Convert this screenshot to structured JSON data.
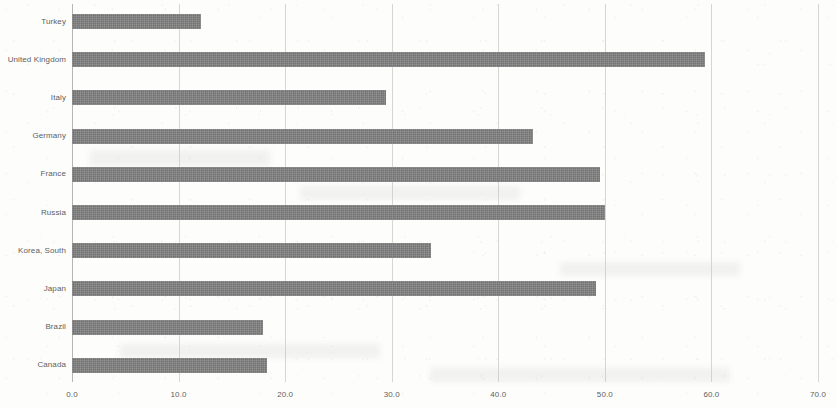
{
  "chart_data": {
    "type": "bar",
    "orientation": "horizontal",
    "title": "",
    "subtitle": "",
    "xlabel": "",
    "ylabel": "",
    "xlim": [
      0.0,
      70.0
    ],
    "xticks": [
      "0.0",
      "10.0",
      "20.0",
      "30.0",
      "40.0",
      "50.0",
      "60.0",
      "70.0"
    ],
    "xtick_values": [
      0,
      10,
      20,
      30,
      40,
      50,
      60,
      70
    ],
    "grid": true,
    "grid_axis": "x",
    "legend": null,
    "legend_position": "none",
    "bar_color": "#7e7e7e",
    "background_color": "#fdfdfc",
    "text_color": "#5d5d5d",
    "categories": [
      "Turkey",
      "United Kingdom",
      "Italy",
      "Germany",
      "France",
      "Russia",
      "Korea, South",
      "Japan",
      "Brazil",
      "Canada"
    ],
    "values": [
      12.1,
      59.4,
      29.5,
      43.3,
      49.5,
      50.0,
      33.7,
      49.2,
      17.9,
      18.3
    ],
    "series": [
      {
        "name": "",
        "values": [
          12.1,
          59.4,
          29.5,
          43.3,
          49.5,
          50.0,
          33.7,
          49.2,
          17.9,
          18.3
        ]
      }
    ]
  }
}
